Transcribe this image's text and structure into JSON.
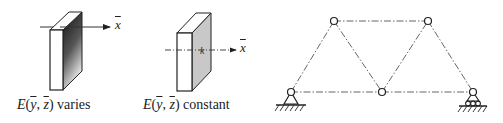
{
  "figure": {
    "panels": [
      {
        "id": "slab-varies",
        "axis_label": "x",
        "caption": {
          "func": "E",
          "args_open": "(",
          "arg1": "y",
          "sep": ", ",
          "arg2": "z",
          "args_close": ")",
          "suffix": " varies"
        },
        "shading": "gradient"
      },
      {
        "id": "slab-constant",
        "axis_label": "x",
        "caption": {
          "func": "E",
          "args_open": "(",
          "arg1": "y",
          "sep": ", ",
          "arg2": "z",
          "args_close": ")",
          "suffix": " constant"
        },
        "shading": "uniform"
      }
    ],
    "truss": {
      "nodes": [
        {
          "id": "A",
          "x": 291,
          "y": 92,
          "support": "pin"
        },
        {
          "id": "B",
          "x": 334,
          "y": 21
        },
        {
          "id": "C",
          "x": 382,
          "y": 92
        },
        {
          "id": "D",
          "x": 428,
          "y": 21
        },
        {
          "id": "E",
          "x": 473,
          "y": 92,
          "support": "roller"
        }
      ],
      "members": [
        [
          "A",
          "B"
        ],
        [
          "B",
          "C"
        ],
        [
          "C",
          "D"
        ],
        [
          "D",
          "E"
        ],
        [
          "B",
          "D"
        ],
        [
          "A",
          "C"
        ],
        [
          "C",
          "E"
        ]
      ],
      "line_style": "dash-dot"
    },
    "colors": {
      "ink": "#222222",
      "uniform_face": "#c8c8c8",
      "gradient_dark": "#111111",
      "gradient_light": "#e8e8e8"
    }
  }
}
